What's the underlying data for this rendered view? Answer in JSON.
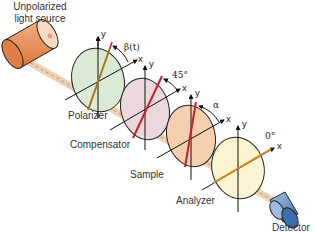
{
  "diagram": {
    "source_label_line1": "Unpolarized",
    "source_label_line2": "light source",
    "detector_label": "Detector",
    "axis_x": "x",
    "axis_y": "y",
    "elements": [
      {
        "name": "Polarizer",
        "label": "Polarizer",
        "angle_label": "β(t)",
        "fill": "#dde9d6",
        "line_color": "#a0781c"
      },
      {
        "name": "Compensator",
        "label": "Compensator",
        "angle_label": "45°",
        "fill": "#ead8dc",
        "line_color": "#c8202a"
      },
      {
        "name": "Sample",
        "label": "Sample",
        "angle_label": "α",
        "fill": "#f6cfae",
        "line_color": "#c8202a"
      },
      {
        "name": "Analyzer",
        "label": "Analyzer",
        "angle_label": "0°",
        "fill": "#fbf4d2",
        "line_color": "#e08a1e"
      }
    ],
    "colors": {
      "source": "#e8925a",
      "detector": "#5b86c4",
      "beam": "#d9b38c"
    }
  }
}
